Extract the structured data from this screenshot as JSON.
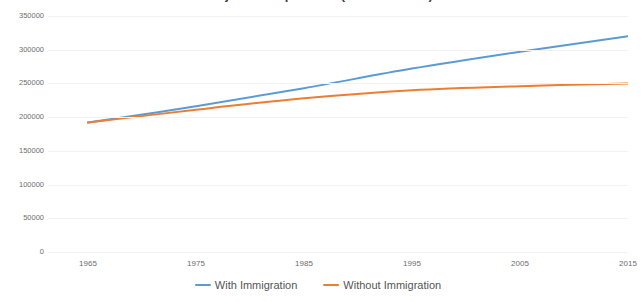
{
  "chart_data": {
    "type": "line",
    "title": "Projected Population (in thousands)",
    "xlabel": "",
    "ylabel": "",
    "x": [
      1965,
      1975,
      1985,
      1995,
      2005,
      2015
    ],
    "xlim": [
      1965,
      2015
    ],
    "ylim": [
      0,
      350000
    ],
    "yticks": [
      0,
      50000,
      100000,
      150000,
      200000,
      250000,
      300000,
      350000
    ],
    "ytick_labels": [
      "0",
      "50000",
      "100000",
      "150000",
      "200000",
      "250000",
      "300000",
      "350000"
    ],
    "xtick_labels": [
      "1965",
      "1975",
      "1985",
      "1995",
      "2005",
      "2015"
    ],
    "grid": true,
    "legend_position": "bottom",
    "series": [
      {
        "name": "With Immigration",
        "color": "#5B9BD5",
        "values": [
          192000,
          216000,
          243000,
          272000,
          297000,
          320000
        ]
      },
      {
        "name": "Without Immigration",
        "color": "#ED7D31",
        "values": [
          192000,
          211000,
          228000,
          240000,
          246000,
          250000
        ]
      }
    ]
  },
  "legend": {
    "entries": [
      {
        "label": "With Immigration",
        "color": "#5B9BD5"
      },
      {
        "label": "Without Immigration",
        "color": "#ED7D31"
      }
    ]
  }
}
